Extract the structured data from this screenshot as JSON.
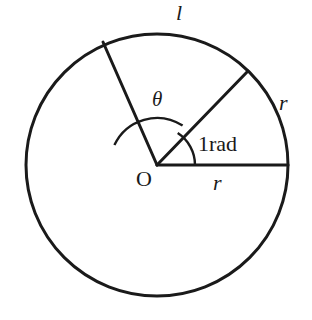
{
  "figure": {
    "kind": "geometry-diagram",
    "background_color": "#ffffff",
    "stroke_color": "#1a1a1a",
    "canvas": {
      "width": 312,
      "height": 320
    }
  },
  "circle": {
    "center_x": 157,
    "center_y": 165,
    "radius": 131,
    "stroke_width": 3
  },
  "radii": [
    {
      "name": "horizontal-radius",
      "angle_deg": 0,
      "end_x": 288,
      "end_y": 165,
      "label": "r"
    },
    {
      "name": "one-radian-radius",
      "angle_deg": 57,
      "end_x": 248,
      "end_y": 71,
      "label": "r"
    },
    {
      "name": "theta-radius",
      "angle_deg": 155,
      "end_x": 103,
      "end_y": 42,
      "label": ""
    }
  ],
  "angle_arcs": [
    {
      "name": "theta-arc",
      "radius": 47,
      "start_deg": 57,
      "end_deg": 155,
      "label": "θ"
    },
    {
      "name": "one-radian-arc",
      "radius": 38,
      "start_deg": 0,
      "end_deg": 57,
      "label": "1rad"
    }
  ],
  "labels": {
    "arc_length": "l",
    "theta": "θ",
    "radius_right": "r",
    "radius_bottom": "r",
    "one_radian": "1rad",
    "origin": "O"
  }
}
